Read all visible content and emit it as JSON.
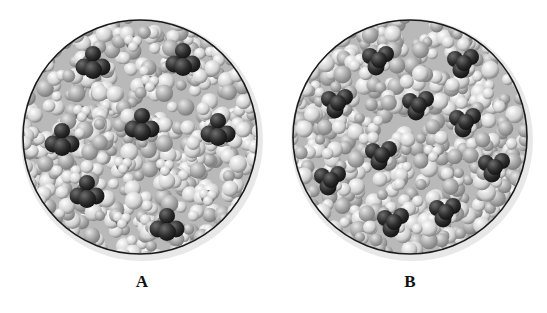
{
  "figure": {
    "panels": [
      {
        "id": "A",
        "label": "A",
        "description": "Solution of tetrahedral molecules (dark spheres) and small molecules (light spheres) dispersed in a solvent of packed light spheres",
        "center": [
          140,
          137
        ],
        "radius": 117,
        "molecules": [
          {
            "type": "dark",
            "x": 93,
            "y": 63
          },
          {
            "type": "light",
            "x": 133,
            "y": 43
          },
          {
            "type": "dark",
            "x": 183,
            "y": 60
          },
          {
            "type": "light",
            "x": 150,
            "y": 83
          },
          {
            "type": "light",
            "x": 82,
            "y": 113
          },
          {
            "type": "dark",
            "x": 142,
            "y": 125
          },
          {
            "type": "dark",
            "x": 218,
            "y": 130
          },
          {
            "type": "dark",
            "x": 62,
            "y": 140
          },
          {
            "type": "light",
            "x": 123,
            "y": 165
          },
          {
            "type": "light",
            "x": 165,
            "y": 167
          },
          {
            "type": "dark",
            "x": 87,
            "y": 192
          },
          {
            "type": "light",
            "x": 208,
            "y": 197
          },
          {
            "type": "light",
            "x": 122,
            "y": 220
          },
          {
            "type": "dark",
            "x": 167,
            "y": 225
          }
        ]
      },
      {
        "id": "B",
        "label": "B",
        "description": "Solution where dark-sphere molecules are surrounded by light atoms (mixed molecules), mostly dark clusters",
        "center": [
          410,
          137
        ],
        "radius": 117,
        "molecules": [
          {
            "type": "mixed",
            "x": 378,
            "y": 60
          },
          {
            "type": "mixed",
            "x": 463,
            "y": 63
          },
          {
            "type": "mixed",
            "x": 337,
            "y": 103
          },
          {
            "type": "mixed",
            "x": 418,
            "y": 105
          },
          {
            "type": "mixed",
            "x": 465,
            "y": 122
          },
          {
            "type": "mixed",
            "x": 381,
            "y": 155
          },
          {
            "type": "light",
            "x": 433,
            "y": 153
          },
          {
            "type": "mixed",
            "x": 330,
            "y": 180
          },
          {
            "type": "mixed",
            "x": 494,
            "y": 167
          },
          {
            "type": "mixed",
            "x": 393,
            "y": 222
          },
          {
            "type": "mixed",
            "x": 445,
            "y": 212
          }
        ]
      }
    ]
  }
}
